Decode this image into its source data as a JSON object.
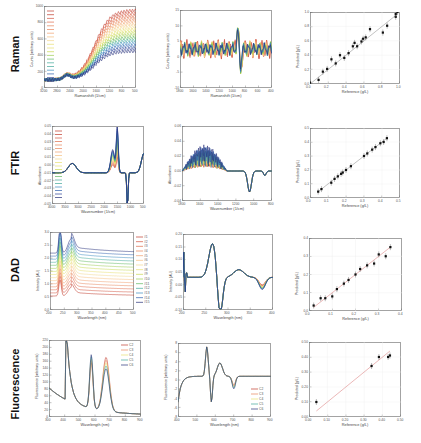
{
  "rows": [
    {
      "label": "Raman"
    },
    {
      "label": "FTIR"
    },
    {
      "label": "DAD"
    },
    {
      "label": "Fluorescence"
    }
  ],
  "chart_data": [
    {
      "id": "raman-raw",
      "type": "line",
      "title": "",
      "xlabel": "Ramanshift (1/cm)",
      "ylabel": "Counts (arbitrary units)",
      "xlim": [
        3200,
        500
      ],
      "ylim": [
        -100,
        1000
      ],
      "xticks": [
        "3200",
        "2800",
        "2400",
        "2000",
        "1600",
        "1200",
        "800",
        "500"
      ],
      "yticks": [
        "0",
        "200",
        "400",
        "600",
        "800",
        "1000"
      ],
      "legend_entries": 20,
      "description": "Stacked Raman spectra rising from ~0 at 3200 to 400-900 counts near 800-500 1/cm, color gradient red to blue"
    },
    {
      "id": "raman-preprocessed",
      "type": "line",
      "xlabel": "Ramanshift (1/cm)",
      "ylabel": "Counts (arbitrary units)",
      "xlim": [
        1800,
        400
      ],
      "ylim": [
        -15,
        15
      ],
      "xticks": [
        "1800",
        "1600",
        "1400",
        "1200",
        "1000",
        "800",
        "600",
        "400"
      ],
      "yticks": [
        "-10",
        "-5",
        "0",
        "5",
        "10",
        "15"
      ],
      "description": "Noisy derivative-like spectra around 0, largest features near 1000-900 1/cm (+11/-10)"
    },
    {
      "id": "raman-prediction",
      "type": "scatter",
      "xlabel": "Reference (g/L)",
      "ylabel": "Predicted (g/L)",
      "xlim": [
        0.0,
        1.05
      ],
      "ylim": [
        0.0,
        1.05
      ],
      "xticks": [
        "0.0",
        "0.2",
        "0.4",
        "0.6",
        "0.8",
        "1.0"
      ],
      "yticks": [
        "0.0",
        "0.2",
        "0.4",
        "0.6",
        "0.8",
        "1.0"
      ],
      "points": [
        [
          0.0,
          0.02
        ],
        [
          0.1,
          0.06
        ],
        [
          0.15,
          0.18
        ],
        [
          0.2,
          0.22
        ],
        [
          0.25,
          0.36
        ],
        [
          0.3,
          0.3
        ],
        [
          0.35,
          0.42
        ],
        [
          0.4,
          0.38
        ],
        [
          0.45,
          0.45
        ],
        [
          0.5,
          0.55
        ],
        [
          0.52,
          0.6
        ],
        [
          0.55,
          0.55
        ],
        [
          0.6,
          0.62
        ],
        [
          0.62,
          0.66
        ],
        [
          0.65,
          0.68
        ],
        [
          0.7,
          0.8
        ],
        [
          0.85,
          0.75
        ],
        [
          0.9,
          0.85
        ],
        [
          1.0,
          0.98
        ],
        [
          1.0,
          1.02
        ],
        [
          1.02,
          1.05
        ]
      ]
    },
    {
      "id": "ftir-raw",
      "type": "line",
      "xlabel": "Wavenumber (1/cm)",
      "ylabel": "Absorbance",
      "xlim": [
        4000,
        400
      ],
      "ylim": [
        -0.06,
        0.06
      ],
      "xticks": [
        "4000",
        "3500",
        "3000",
        "2500",
        "2000",
        "1500",
        "1000",
        "500"
      ],
      "yticks": [
        "-0.05",
        "-0.04",
        "-0.03",
        "-0.02",
        "-0.01",
        "0.00",
        "0.01",
        "0.02",
        "0.03",
        "0.04",
        "0.05"
      ],
      "legend_entries": 20,
      "description": "Broad O-H band ~3300, strong multi-colored peaks 1700-1000, sharp negative dip near 900"
    },
    {
      "id": "ftir-preprocessed",
      "type": "line",
      "xlabel": "Wavenumber (1/cm)",
      "ylabel": "Absorbance",
      "xlim": [
        1800,
        400
      ],
      "ylim": [
        -0.04,
        0.06
      ],
      "xticks": [
        "1800",
        "1600",
        "1400",
        "1200",
        "1000",
        "800"
      ],
      "yticks": [
        "-0.04",
        "-0.02",
        "0.00",
        "0.02",
        "0.04",
        "0.06"
      ],
      "description": "Multicolor noisy peaks 1800-1200, then single gray trace with dip near 900"
    },
    {
      "id": "ftir-prediction",
      "type": "scatter",
      "xlabel": "Reference (g/L)",
      "ylabel": "Predicted (g/L)",
      "xlim": [
        -0.05,
        0.5
      ],
      "ylim": [
        -0.05,
        0.5
      ],
      "xticks": [
        "0.0",
        "0.1",
        "0.2",
        "0.3",
        "0.4",
        "0.5"
      ],
      "yticks": [
        "0.0",
        "0.1",
        "0.2",
        "0.3",
        "0.4",
        "0.5"
      ],
      "points": [
        [
          0.0,
          0.0
        ],
        [
          0.02,
          0.02
        ],
        [
          0.08,
          0.07
        ],
        [
          0.1,
          0.1
        ],
        [
          0.12,
          0.12
        ],
        [
          0.14,
          0.14
        ],
        [
          0.15,
          0.15
        ],
        [
          0.17,
          0.17
        ],
        [
          0.2,
          0.2
        ],
        [
          0.28,
          0.28
        ],
        [
          0.3,
          0.3
        ],
        [
          0.33,
          0.33
        ],
        [
          0.35,
          0.35
        ],
        [
          0.38,
          0.38
        ],
        [
          0.4,
          0.39
        ],
        [
          0.42,
          0.42
        ]
      ]
    },
    {
      "id": "dad-raw",
      "type": "line",
      "xlabel": "Wavelength (nm)",
      "ylabel": "Intensity (AU)",
      "xlim": [
        190,
        520
      ],
      "ylim": [
        0.0,
        3.0
      ],
      "xticks": [
        "200",
        "250",
        "300",
        "350",
        "400",
        "450",
        "500"
      ],
      "yticks": [
        "0.0",
        "0.5",
        "1.0",
        "1.5",
        "2.0",
        "2.5",
        "3.0"
      ],
      "legend": [
        "#1",
        "#2",
        "#3",
        "#4",
        "#5",
        "#6",
        "#7",
        "#8",
        "#9",
        "#10",
        "#11",
        "#12",
        "#13",
        "#14",
        "#15"
      ],
      "description": "Sharp peak ~225 nm, broad shoulder ~275 nm, decaying tails; offsets colored red (#1) to blue (#15)"
    },
    {
      "id": "dad-preprocessed",
      "type": "line",
      "xlabel": "Wavelength (nm)",
      "ylabel": "Intensity (AU)",
      "xlim": [
        190,
        420
      ],
      "ylim": [
        -0.15,
        0.2
      ],
      "xticks": [
        "200",
        "250",
        "300",
        "350",
        "400"
      ],
      "yticks": [
        "-0.10",
        "-0.05",
        "0.00",
        "0.05",
        "0.10",
        "0.15",
        "0.20"
      ],
      "description": "Derivative spectra: positive peak ~0.13 at ~270 nm, negative trough ~-0.12 at ~290 nm, smaller dip at ~390 nm"
    },
    {
      "id": "dad-prediction",
      "type": "scatter",
      "xlabel": "Reference (g/L)",
      "ylabel": "Predicted (g/L)",
      "xlim": [
        0.0,
        0.4
      ],
      "ylim": [
        0.0,
        0.4
      ],
      "xticks": [
        "0.0",
        "0.1",
        "0.2",
        "0.3",
        "0.4"
      ],
      "yticks": [
        "0.0",
        "0.1",
        "0.2",
        "0.3",
        "0.4"
      ],
      "points": [
        [
          0.02,
          0.03
        ],
        [
          0.05,
          0.07
        ],
        [
          0.07,
          0.07
        ],
        [
          0.1,
          0.08
        ],
        [
          0.12,
          0.12
        ],
        [
          0.15,
          0.15
        ],
        [
          0.17,
          0.17
        ],
        [
          0.2,
          0.2
        ],
        [
          0.22,
          0.23
        ],
        [
          0.25,
          0.25
        ],
        [
          0.28,
          0.26
        ],
        [
          0.3,
          0.31
        ],
        [
          0.33,
          0.3
        ],
        [
          0.35,
          0.35
        ]
      ]
    },
    {
      "id": "fluorescence-raw",
      "type": "line",
      "xlabel": "Wavelength (nm)",
      "ylabel": "Fluorescence (arbitrary units)",
      "xlim": [
        300,
        900
      ],
      "ylim": [
        0,
        220
      ],
      "xticks": [
        "300",
        "400",
        "500",
        "600",
        "700",
        "800",
        "900"
      ],
      "yticks": [
        "0",
        "20",
        "40",
        "60",
        "80",
        "100",
        "120",
        "140",
        "160",
        "180",
        "200",
        "220"
      ],
      "legend": [
        "C2",
        "C3",
        "C4",
        "C5",
        "C6"
      ],
      "description": "Steep decay from 410 nm, peak ~140 at ~575 nm, peak ~165 at ~680 nm, tail to ~10 at 900"
    },
    {
      "id": "fluorescence-preprocessed",
      "type": "line",
      "xlabel": "Wavelength (nm)",
      "ylabel": "Fluorescence (arbitrary units)",
      "xlim": [
        400,
        900
      ],
      "ylim": [
        -8,
        8
      ],
      "xticks": [
        "400",
        "500",
        "600",
        "700",
        "800",
        "900"
      ],
      "yticks": [
        "-8",
        "-6",
        "-4",
        "-2",
        "0",
        "2",
        "4",
        "6",
        "8"
      ],
      "legend": [
        "C2",
        "C3",
        "C4",
        "C5",
        "C6"
      ],
      "description": "Sharp positive peak ~7 near 575 nm, negative dip ~-5 near 600 nm, broad hump ~3 near 620 nm, dip ~-2 near 700 nm"
    },
    {
      "id": "fluorescence-prediction",
      "type": "scatter",
      "xlabel": "Reference (g/L)",
      "ylabel": "Predicted (g/L)",
      "xlim": [
        0.0,
        0.5
      ],
      "ylim": [
        0.0,
        0.5
      ],
      "xticks": [
        "0.00",
        "0.10",
        "0.20",
        "0.30",
        "0.40",
        "0.50"
      ],
      "yticks": [
        "0.00",
        "0.10",
        "0.20",
        "0.30",
        "0.40",
        "0.50"
      ],
      "points": [
        [
          0.04,
          0.1
        ],
        [
          0.34,
          0.34
        ],
        [
          0.38,
          0.4
        ],
        [
          0.43,
          0.4
        ],
        [
          0.44,
          0.41
        ]
      ]
    }
  ]
}
